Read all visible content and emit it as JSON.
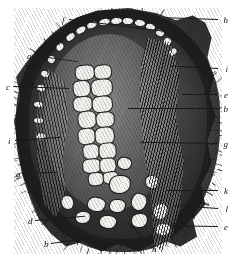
{
  "figure": {
    "kind": "botanical-cross-section-engraving",
    "medium": "monochrome line-and-stipple engraving",
    "background_color": "#ffffff",
    "ink_color": "#1a1a1a"
  },
  "labels": [
    {
      "id": "f",
      "text": "f",
      "x": 62,
      "y": 21,
      "line_length": 96,
      "line_angle": 7,
      "side": "left"
    },
    {
      "id": "h1",
      "text": "h",
      "x": 222,
      "y": 21,
      "line_length": 52,
      "line_angle": 182,
      "side": "right"
    },
    {
      "id": "a",
      "text": "a",
      "x": 27,
      "y": 57,
      "line_length": 44,
      "line_angle": 8,
      "side": "left"
    },
    {
      "id": "i1",
      "text": "i",
      "x": 222,
      "y": 70,
      "line_length": 48,
      "line_angle": 183,
      "side": "right"
    },
    {
      "id": "c",
      "text": "c",
      "x": 6,
      "y": 88,
      "line_length": 56,
      "line_angle": 2,
      "side": "left"
    },
    {
      "id": "e1",
      "text": "e",
      "x": 222,
      "y": 96,
      "line_length": 36,
      "line_angle": 180,
      "side": "right"
    },
    {
      "id": "b1",
      "text": "b",
      "x": 222,
      "y": 110,
      "line_length": 90,
      "line_angle": 180,
      "side": "right"
    },
    {
      "id": "i2",
      "text": "i",
      "x": 8,
      "y": 142,
      "line_length": 46,
      "line_angle": 356,
      "side": "left"
    },
    {
      "id": "g1",
      "text": "g",
      "x": 222,
      "y": 145,
      "line_length": 78,
      "line_angle": 181,
      "side": "right"
    },
    {
      "id": "g2",
      "text": "g",
      "x": 16,
      "y": 175,
      "line_length": 34,
      "line_angle": 358,
      "side": "left"
    },
    {
      "id": "k1",
      "text": "k",
      "x": 222,
      "y": 192,
      "line_length": 52,
      "line_angle": 180,
      "side": "right"
    },
    {
      "id": "l",
      "text": "l",
      "x": 222,
      "y": 210,
      "line_length": 44,
      "line_angle": 184,
      "side": "right"
    },
    {
      "id": "d",
      "text": "d",
      "x": 28,
      "y": 222,
      "line_length": 50,
      "line_angle": 355,
      "side": "left"
    },
    {
      "id": "e2",
      "text": "e",
      "x": 222,
      "y": 228,
      "line_length": 48,
      "line_angle": 181,
      "side": "right"
    },
    {
      "id": "b2",
      "text": "b",
      "x": 44,
      "y": 245,
      "line_length": 44,
      "line_angle": 352,
      "side": "left"
    },
    {
      "id": "h2",
      "text": "h",
      "x": 152,
      "y": 250,
      "line_length": 34,
      "line_angle": 228,
      "side": "bottom"
    }
  ],
  "structures": {
    "cortex": "dark fibrous outer cortex ring",
    "rim_cells": "ring of bright elongated cells beneath upper cortex",
    "medulla": "stippled grey inner ground tissue",
    "vascular_column": "central column of large pale polygonal cells",
    "lacunae": "large irregular white air spaces at the base",
    "fibre_bundle": "striated fibre strand sweeping from upper right to base"
  }
}
